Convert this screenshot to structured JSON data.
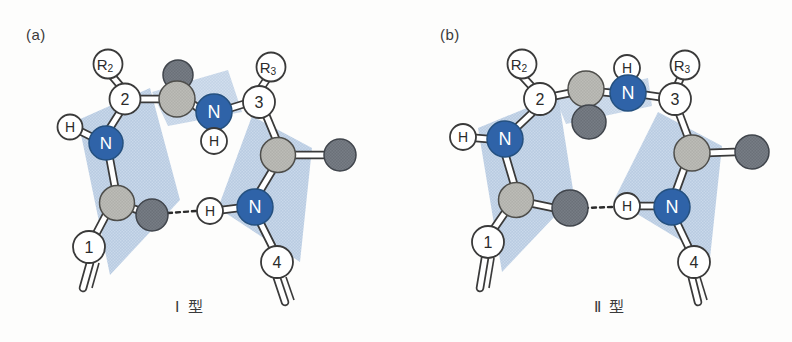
{
  "figure": {
    "background_color": "#fdfdfc",
    "width": 792,
    "height": 342
  },
  "palette": {
    "nitrogen_blue": "#2f63a8",
    "carbon_gray": "#b0b0ab",
    "oxygen_dark_gray": "#6b7078",
    "plane_blue": "#b4c8e0",
    "outline": "#3a3a3a",
    "bond_white": "#ffffff",
    "text_dark": "#2b2b2b",
    "text_light": "#ffffff"
  },
  "panels": [
    {
      "tag": "(a)",
      "caption": "Ⅰ 型",
      "atoms": {
        "r2": "R",
        "r2_sub": "2",
        "r3": "R",
        "r3_sub": "3",
        "c1": "1",
        "c2": "2",
        "c3": "3",
        "c4": "4",
        "n_left": "N",
        "n_mid": "N",
        "n_right": "N",
        "h_left": "H",
        "h_mid": "H",
        "h_bond": "H"
      }
    },
    {
      "tag": "(b)",
      "caption": "Ⅱ 型",
      "atoms": {
        "r2": "R",
        "r2_sub": "2",
        "r3": "R",
        "r3_sub": "3",
        "c1": "1",
        "c2": "2",
        "c3": "3",
        "c4": "4",
        "n_left": "N",
        "n_mid": "N",
        "n_right": "N",
        "h_left": "H",
        "h_mid": "H",
        "h_bond": "H"
      }
    }
  ]
}
